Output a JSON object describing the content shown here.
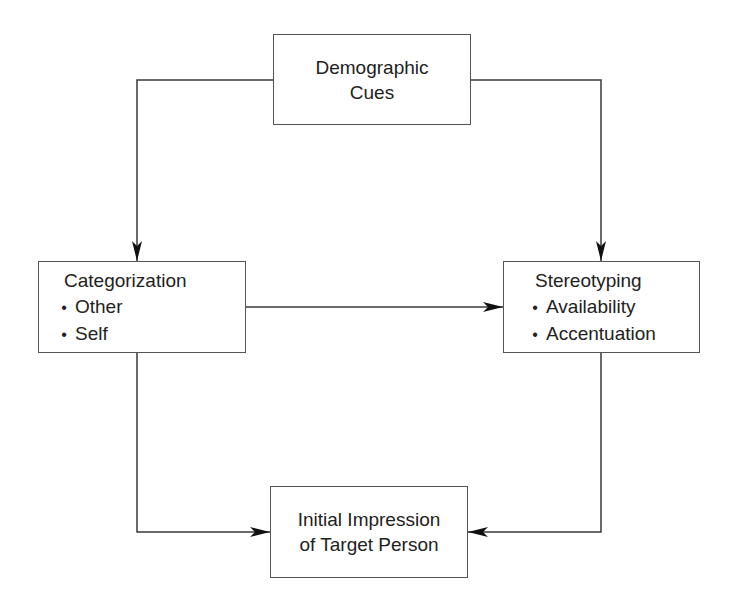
{
  "diagram": {
    "nodes": {
      "demographic": {
        "lines": [
          "Demographic",
          "Cues"
        ]
      },
      "categorization": {
        "title": "Categorization",
        "items": [
          "Other",
          "Self"
        ]
      },
      "stereotyping": {
        "title": "Stereotyping",
        "items": [
          "Availability",
          "Accentuation"
        ]
      },
      "impression": {
        "lines": [
          "Initial Impression",
          "of Target Person"
        ]
      }
    },
    "bullet_glyph": "•",
    "edges": [
      {
        "from": "Demographic Cues",
        "to": "Categorization"
      },
      {
        "from": "Demographic Cues",
        "to": "Stereotyping"
      },
      {
        "from": "Categorization",
        "to": "Stereotyping"
      },
      {
        "from": "Categorization",
        "to": "Initial Impression of Target Person"
      },
      {
        "from": "Stereotyping",
        "to": "Initial Impression of Target Person"
      }
    ],
    "colors": {
      "line": "#3a3a3a",
      "border": "#555555",
      "text": "#222222",
      "background": "#ffffff"
    }
  }
}
